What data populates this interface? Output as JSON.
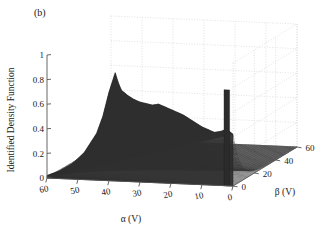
{
  "figure": {
    "panel_label": "(b)",
    "background_color": "#ffffff",
    "surface_color": "#3a3a3a",
    "grid_color": "#cfcfd4",
    "axis_color": "#555555"
  },
  "axes": {
    "y": {
      "title": "Identified Density Function",
      "ticks": [
        "0",
        "0.2",
        "0.4",
        "0.6",
        "0.8",
        "1"
      ],
      "values": [
        0,
        0.2,
        0.4,
        0.6,
        0.8,
        1
      ],
      "min": 0,
      "max": 1
    },
    "x": {
      "title": "α (V)",
      "ticks": [
        "60",
        "50",
        "40",
        "30",
        "20",
        "10",
        "0"
      ],
      "values": [
        60,
        50,
        40,
        30,
        20,
        10,
        0
      ],
      "min": 0,
      "max": 60,
      "direction": "descending-left-to-right"
    },
    "z": {
      "title": "β (V)",
      "ticks": [
        "0",
        "20",
        "40",
        "60"
      ],
      "values": [
        0,
        20,
        40,
        60
      ],
      "min": 0,
      "max": 60,
      "direction": "ascending-toward-back-right"
    }
  },
  "chart_data": {
    "type": "surface",
    "title": "",
    "subtitle": "",
    "xlabel": "α (V)",
    "ylabel": "Identified Density Function",
    "zlabel": "β (V)",
    "xlim": [
      0,
      60
    ],
    "zlim": [
      0,
      60
    ],
    "ylim": [
      0,
      1
    ],
    "grid": true,
    "legend": "none",
    "view": "3d-mesh-surface",
    "x": [
      0,
      2,
      4,
      6,
      8,
      10,
      12,
      14,
      16,
      18,
      20,
      22,
      24,
      26,
      28,
      30,
      32,
      34,
      36,
      38,
      40,
      42,
      44,
      46,
      48,
      50,
      52,
      54,
      56,
      58,
      60
    ],
    "z": [
      0,
      4,
      8,
      12,
      16,
      20,
      24,
      28,
      32,
      36,
      40,
      44,
      48,
      52,
      56,
      60
    ],
    "ridge_profile_at_beta0": [
      {
        "alpha": 60,
        "value": 0.02
      },
      {
        "alpha": 56,
        "value": 0.06
      },
      {
        "alpha": 52,
        "value": 0.12
      },
      {
        "alpha": 48,
        "value": 0.22
      },
      {
        "alpha": 44,
        "value": 0.38
      },
      {
        "alpha": 42,
        "value": 0.52
      },
      {
        "alpha": 40,
        "value": 0.72
      },
      {
        "alpha": 38,
        "value": 0.88
      },
      {
        "alpha": 37,
        "value": 0.8
      },
      {
        "alpha": 36,
        "value": 0.74
      },
      {
        "alpha": 34,
        "value": 0.7
      },
      {
        "alpha": 32,
        "value": 0.67
      },
      {
        "alpha": 30,
        "value": 0.65
      },
      {
        "alpha": 28,
        "value": 0.64
      },
      {
        "alpha": 26,
        "value": 0.63
      },
      {
        "alpha": 24,
        "value": 0.64
      },
      {
        "alpha": 22,
        "value": 0.62
      },
      {
        "alpha": 20,
        "value": 0.6
      },
      {
        "alpha": 18,
        "value": 0.58
      },
      {
        "alpha": 16,
        "value": 0.56
      },
      {
        "alpha": 14,
        "value": 0.53
      },
      {
        "alpha": 12,
        "value": 0.5
      },
      {
        "alpha": 10,
        "value": 0.47
      },
      {
        "alpha": 8,
        "value": 0.45
      },
      {
        "alpha": 6,
        "value": 0.43
      },
      {
        "alpha": 4,
        "value": 0.44
      },
      {
        "alpha": 2,
        "value": 0.46
      },
      {
        "alpha": 0,
        "value": 0.42
      }
    ],
    "isolated_spike": {
      "alpha": 2,
      "beta": 0,
      "value": 0.78
    },
    "decay_in_beta": "exponential",
    "beta_decay_constant": 9
  }
}
